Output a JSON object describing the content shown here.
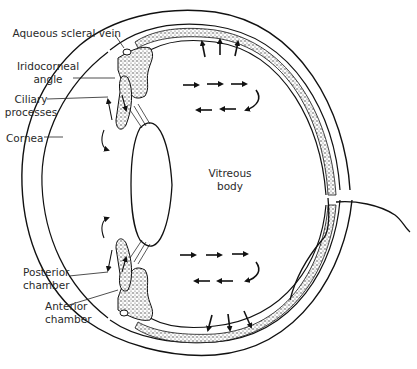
{
  "figure": {
    "labels": {
      "aqueous_scleral_vein": "Aqueous scleral vein",
      "iridocorneal_angle_1": "Iridocorneal",
      "iridocorneal_angle_2": "angle",
      "ciliary_processes_1": "Ciliary",
      "ciliary_processes_2": "processes",
      "cornea": "Cornea",
      "vitreous_body_1": "Vitreous",
      "vitreous_body_2": "body",
      "posterior_chamber_1": "Posterior",
      "posterior_chamber_2": "chamber",
      "anterior_chamber_1": "Anterior",
      "anterior_chamber_2": "chamber"
    },
    "flow_arrows": {
      "upper_outward": 3,
      "upper_right_row": 3,
      "upper_left_row": 3,
      "lower_right_row": 3,
      "lower_left_row": 3,
      "lower_outward": 3
    },
    "colors": {
      "line": "#111111",
      "text": "#2a2a2a",
      "background": "#ffffff"
    }
  }
}
